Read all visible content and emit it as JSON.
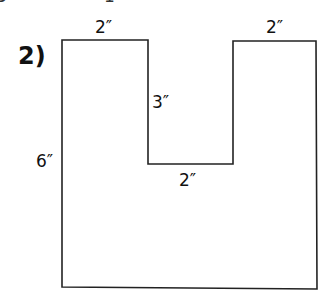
{
  "problem": {
    "number": "2)",
    "shape": "U-shaped polygon (rectangle with rectangular notch cut from top center)",
    "labels": {
      "top_left_width": "2″",
      "top_right_width": "2″",
      "notch_depth": "3″",
      "left_height": "6″",
      "notch_width": "2″"
    }
  },
  "fragments": {
    "top_clip_a": "3",
    "top_clip_b": "1"
  },
  "style": {
    "stroke": "#222222",
    "background": "#ffffff"
  }
}
